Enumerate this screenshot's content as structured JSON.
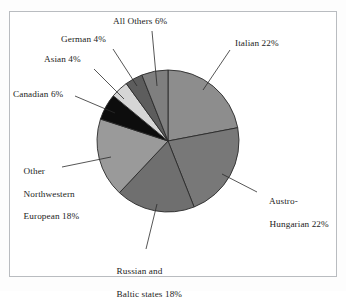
{
  "figure": {
    "frame_color": "#b9bcc0",
    "background": "#ffffff"
  },
  "chart_data": {
    "type": "pie",
    "title": "",
    "xlabel": "",
    "ylabel": "",
    "legend_position": "none",
    "grid": false,
    "units": "percent",
    "start_angle_deg": 0,
    "direction": "clockwise",
    "categories": [
      "Italian",
      "Austro-Hungarian",
      "Russian and Baltic states",
      "Other Northwestern European",
      "Canadian",
      "Asian",
      "German",
      "All Others"
    ],
    "values": [
      22,
      22,
      18,
      18,
      6,
      4,
      4,
      6
    ],
    "colors": [
      "#8d8d8d",
      "#787878",
      "#6f6f6f",
      "#9a9a9a",
      "#0d0d0d",
      "#d6d6d6",
      "#5d5d5d",
      "#7f7f7f"
    ],
    "slices": [
      {
        "label": "Italian",
        "value": 22,
        "display": "Italian 22%",
        "color": "#8d8d8d"
      },
      {
        "label": "Austro-Hungarian",
        "value": 22,
        "display": "Austro-Hungarian 22%",
        "color": "#787878"
      },
      {
        "label": "Russian and Baltic states",
        "value": 18,
        "display": "Russian and Baltic states 18%",
        "color": "#6f6f6f"
      },
      {
        "label": "Other Northwestern European",
        "value": 18,
        "display": "Other Northwestern European 18%",
        "color": "#9a9a9a"
      },
      {
        "label": "Canadian",
        "value": 6,
        "display": "Canadian 6%",
        "color": "#0d0d0d"
      },
      {
        "label": "Asian",
        "value": 4,
        "display": "Asian 4%",
        "color": "#d6d6d6"
      },
      {
        "label": "German",
        "value": 4,
        "display": "German 4%",
        "color": "#5d5d5d"
      },
      {
        "label": "All Others",
        "value": 6,
        "display": "All Others 6%",
        "color": "#7f7f7f"
      }
    ]
  },
  "labels": {
    "all_others": "All Others 6%",
    "german": "German 4%",
    "asian": "Asian 4%",
    "canadian": "Canadian 6%",
    "italian": "Italian 22%",
    "austro_hungarian_line1": "Austro-",
    "austro_hungarian_line2": "Hungarian 22%",
    "other_nw_european_line1": "Other",
    "other_nw_european_line2": "Northwestern",
    "other_nw_european_line3": "European 18%",
    "russian_baltic_line1": "Russian and",
    "russian_baltic_line2": "Baltic states 18%"
  }
}
